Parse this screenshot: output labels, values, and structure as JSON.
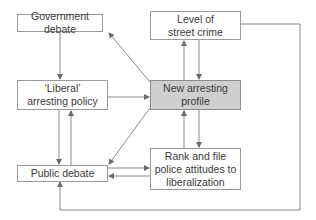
{
  "diagram": {
    "type": "flow",
    "nodes": {
      "government_debate": {
        "label": "Government debate"
      },
      "street_crime": {
        "label": "Level of street crime"
      },
      "liberal_policy": {
        "label": "‘Liberal’ arresting policy"
      },
      "new_profile": {
        "label": "New arresting profile",
        "highlight_color": "#cfcfcf"
      },
      "public_debate": {
        "label": "Public debate"
      },
      "police_attitudes": {
        "label": "Rank and file police attitudes to liberalization"
      }
    },
    "edges": [
      {
        "from": "government_debate",
        "to": "liberal_policy"
      },
      {
        "from": "liberal_policy",
        "to": "new_profile"
      },
      {
        "from": "new_profile",
        "to": "government_debate"
      },
      {
        "from": "new_profile",
        "to": "street_crime"
      },
      {
        "from": "street_crime",
        "to": "new_profile"
      },
      {
        "from": "new_profile",
        "to": "police_attitudes"
      },
      {
        "from": "police_attitudes",
        "to": "new_profile"
      },
      {
        "from": "new_profile",
        "to": "public_debate"
      },
      {
        "from": "liberal_policy",
        "to": "public_debate"
      },
      {
        "from": "public_debate",
        "to": "liberal_policy"
      },
      {
        "from": "public_debate",
        "to": "police_attitudes"
      },
      {
        "from": "police_attitudes",
        "to": "public_debate"
      },
      {
        "from": "street_crime",
        "to": "public_debate"
      }
    ],
    "line_color": "#8a8a8a"
  }
}
